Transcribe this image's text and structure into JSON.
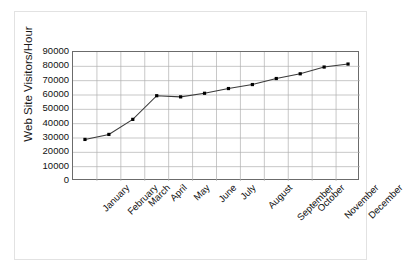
{
  "chart_data": {
    "type": "line",
    "title": "",
    "subtitle": "",
    "xlabel": "",
    "ylabel": "Web Site Visitors/Hour",
    "categories": [
      "January",
      "February",
      "March",
      "April",
      "May",
      "June",
      "July",
      "August",
      "September",
      "October",
      "November",
      "December"
    ],
    "values": [
      29000,
      32500,
      43000,
      59500,
      58700,
      61200,
      64500,
      67300,
      71500,
      74800,
      79500,
      81600
    ],
    "series": [
      {
        "name": "Web Site Visitors/Hour",
        "values": [
          29000,
          32500,
          43000,
          59500,
          58700,
          61200,
          64500,
          67300,
          71500,
          74800,
          79500,
          81600
        ]
      }
    ],
    "ylim": [
      0,
      90000
    ],
    "y_ticks": [
      0,
      10000,
      20000,
      30000,
      40000,
      50000,
      60000,
      70000,
      80000,
      90000
    ],
    "y_tick_labels": [
      "0",
      "10000",
      "20000",
      "30000",
      "40000",
      "50000",
      "60000",
      "70000",
      "80000",
      "90000"
    ],
    "grid": {
      "horizontal": true,
      "vertical": true,
      "color": "#b0b0b0"
    },
    "legend": {
      "visible": false,
      "position": "none",
      "entries": []
    },
    "line": {
      "color": "#3a3a3a",
      "width": 1.1,
      "marker": "square",
      "marker_color": "#000000",
      "marker_size": 3.2
    },
    "axes": {
      "border_color": "#6b6b6b",
      "background": "#ffffff"
    },
    "frame": {
      "border_color": "#e2e2e2",
      "background": "#ffffff"
    }
  }
}
